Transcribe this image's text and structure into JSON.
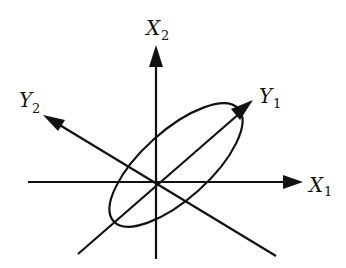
{
  "diagram": {
    "type": "coordinate-rotation",
    "stroke_color": "#111111",
    "background": "#ffffff",
    "axes": [
      {
        "id": "X1",
        "label": "X",
        "subscript": "1"
      },
      {
        "id": "X2",
        "label": "X",
        "subscript": "2"
      },
      {
        "id": "Y1",
        "label": "Y",
        "subscript": "1"
      },
      {
        "id": "Y2",
        "label": "Y",
        "subscript": "2"
      }
    ],
    "ellipse": {
      "shape": "ellipse",
      "orientation": "aligned with Y1 axis"
    }
  }
}
